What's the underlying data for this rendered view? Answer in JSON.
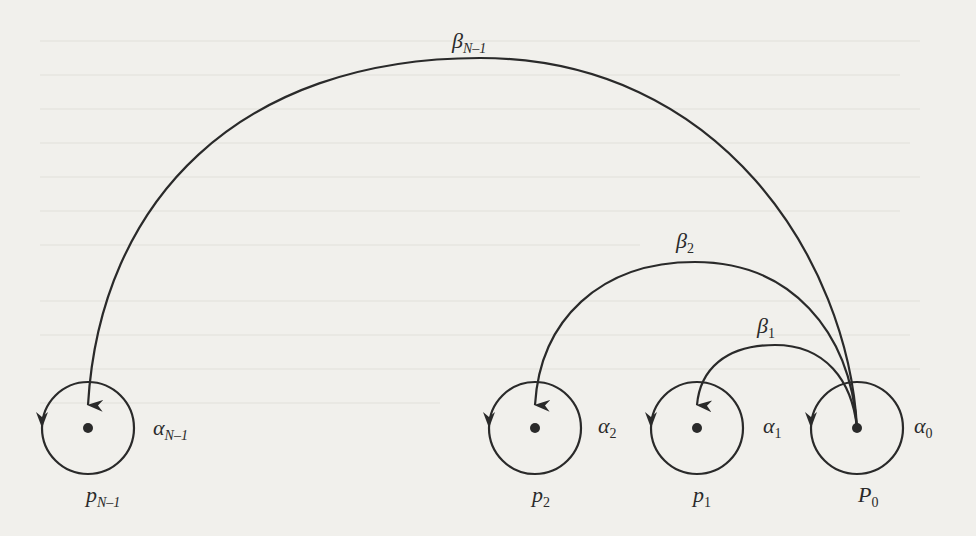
{
  "diagram": {
    "colors": {
      "stroke": "#2a2a2a",
      "background": "#f1f0ec"
    },
    "nodes": [
      {
        "id": "pN-1",
        "label_main": "p",
        "label_sub": "N–1",
        "loop_label_main": "α",
        "loop_label_sub": "N–1"
      },
      {
        "id": "p2",
        "label_main": "p",
        "label_sub": "2",
        "loop_label_main": "α",
        "loop_label_sub": "2"
      },
      {
        "id": "p1",
        "label_main": "p",
        "label_sub": "1",
        "loop_label_main": "α",
        "loop_label_sub": "1"
      },
      {
        "id": "P0",
        "label_main": "P",
        "label_sub": "0",
        "loop_label_main": "α",
        "loop_label_sub": "0"
      }
    ],
    "edges": [
      {
        "from": "P0",
        "to": "pN-1",
        "label_main": "β",
        "label_sub": "N–1"
      },
      {
        "from": "P0",
        "to": "p2",
        "label_main": "β",
        "label_sub": "2"
      },
      {
        "from": "P0",
        "to": "p1",
        "label_main": "β",
        "label_sub": "1"
      }
    ]
  }
}
